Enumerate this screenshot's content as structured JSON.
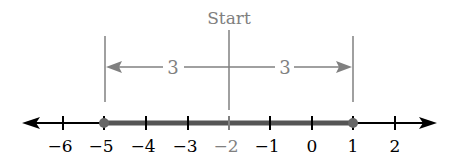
{
  "diagram": {
    "title_label": "Start",
    "start_value": -2,
    "distance_left_label": "3",
    "distance_right_label": "3",
    "endpoints": [
      -5,
      1
    ],
    "axis": {
      "min_visible": -6,
      "max_visible": 2,
      "ticks": [
        {
          "value": -6,
          "label": "−6"
        },
        {
          "value": -5,
          "label": "−5"
        },
        {
          "value": -4,
          "label": "−4"
        },
        {
          "value": -3,
          "label": "−3"
        },
        {
          "value": -2,
          "label": "−2"
        },
        {
          "value": -1,
          "label": "−1"
        },
        {
          "value": 0,
          "label": "0"
        },
        {
          "value": 1,
          "label": "1"
        },
        {
          "value": 2,
          "label": "2"
        }
      ]
    },
    "colors": {
      "axis": "#000000",
      "annotation": "#808080",
      "highlight_segment": "#555555",
      "endpoint_dot": "#666666"
    }
  }
}
